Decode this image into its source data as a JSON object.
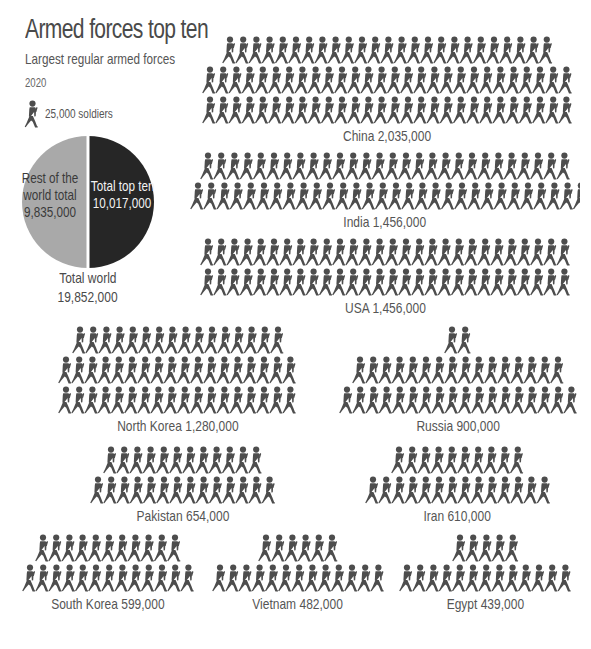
{
  "header": {
    "title": "Armed forces top ten",
    "subtitle": "Largest regular armed forces",
    "year": "2020"
  },
  "legend": {
    "icon": "soldier-icon",
    "label": "25,000 soldiers",
    "unit_value": 25000
  },
  "pie": {
    "rest_label_lines": [
      "Rest of the",
      "world total",
      "9,835,000"
    ],
    "top_label_lines": [
      "Total top ten",
      "10,017,000"
    ],
    "total_lines": [
      "Total world",
      "19,852,000"
    ],
    "colors": {
      "rest": "#a9a9a9",
      "top_ten": "#262626",
      "divider": "#ffffff"
    }
  },
  "colors": {
    "soldier": "#4d4d4d",
    "text": "#4a4a4a",
    "background": "#ffffff"
  },
  "chart_data": [
    {
      "type": "pie",
      "title": "Total world 19,852,000",
      "categories": [
        "Total top ten",
        "Rest of the world total"
      ],
      "values": [
        10017000,
        9835000
      ]
    },
    {
      "type": "bar",
      "title": "Armed forces top ten — Largest regular armed forces, 2020",
      "subtitle": "Pictogram: 1 icon = 25,000 soldiers",
      "categories": [
        "China",
        "India",
        "USA",
        "North Korea",
        "Russia",
        "Pakistan",
        "Iran",
        "South Korea",
        "Vietnam",
        "Egypt"
      ],
      "values": [
        2035000,
        1456000,
        1456000,
        1280000,
        900000,
        654000,
        610000,
        599000,
        482000,
        439000
      ],
      "icon_counts": [
        81,
        58,
        58,
        52,
        36,
        26,
        24,
        24,
        19,
        18
      ],
      "xlabel": "",
      "ylabel": "Soldiers"
    }
  ],
  "countries": [
    {
      "id": "china",
      "label": "China 2,035,000",
      "rows": [
        25,
        28,
        28
      ],
      "x": 195,
      "y": 36,
      "w": 385
    },
    {
      "id": "india",
      "label": "India 1,456,000",
      "rows": [
        28,
        30
      ],
      "x": 190,
      "y": 152,
      "w": 390
    },
    {
      "id": "usa",
      "label": "USA 1,456,000",
      "rows": [
        29,
        29
      ],
      "x": 200,
      "y": 238,
      "w": 370
    },
    {
      "id": "north-korea",
      "label": "North Korea 1,280,000",
      "rows": [
        16,
        18,
        18
      ],
      "x": 55,
      "y": 326,
      "w": 245
    },
    {
      "id": "russia",
      "label": "Russia 900,000",
      "rows": [
        2,
        16,
        18
      ],
      "x": 338,
      "y": 326,
      "w": 240
    },
    {
      "id": "pakistan",
      "label": "Pakistan 654,000",
      "rows": [
        12,
        14
      ],
      "x": 85,
      "y": 446,
      "w": 195
    },
    {
      "id": "iran",
      "label": "Iran 610,000",
      "rows": [
        10,
        14
      ],
      "x": 360,
      "y": 446,
      "w": 195
    },
    {
      "id": "south-korea",
      "label": "South Korea 599,000",
      "rows": [
        11,
        13
      ],
      "x": 18,
      "y": 534,
      "w": 180
    },
    {
      "id": "vietnam",
      "label": "Vietnam 482,000",
      "rows": [
        6,
        13
      ],
      "x": 208,
      "y": 534,
      "w": 180
    },
    {
      "id": "egypt",
      "label": "Egypt 439,000",
      "rows": [
        5,
        13
      ],
      "x": 395,
      "y": 534,
      "w": 180
    }
  ]
}
